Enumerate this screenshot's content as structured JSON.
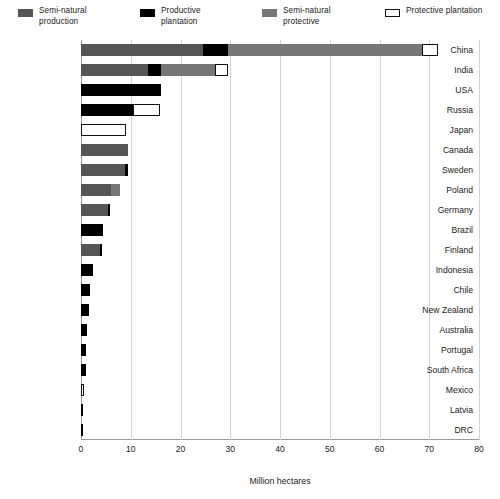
{
  "legend": {
    "items": [
      {
        "label": "Semi-natural\nproduction",
        "key": "sn-prod",
        "color": "#555555"
      },
      {
        "label": "Productive\nplantation",
        "key": "prod-plant",
        "color": "#000000"
      },
      {
        "label": "Semi-natural\nprotective",
        "key": "sn-prot",
        "color": "#777777"
      },
      {
        "label": "Protective plantation",
        "key": "prot-plant",
        "color": "#ffffff"
      }
    ]
  },
  "axis": {
    "x_title": "Million hectares",
    "x_ticks": [
      "0",
      "10",
      "20",
      "30",
      "40",
      "50",
      "60",
      "70",
      "80"
    ]
  },
  "chart_data": {
    "type": "bar",
    "orientation": "horizontal",
    "stacked": true,
    "title": "",
    "xlabel": "Million hectares",
    "ylabel": "",
    "xlim": [
      0,
      80
    ],
    "xticks": [
      0,
      10,
      20,
      30,
      40,
      50,
      60,
      70,
      80
    ],
    "grid": true,
    "legend_position": "top",
    "categories": [
      "China",
      "India",
      "USA",
      "Russia",
      "Japan",
      "Canada",
      "Sweden",
      "Poland",
      "Germany",
      "Brazil",
      "Finland",
      "Indonesia",
      "Chile",
      "New Zealand",
      "Australia",
      "Portugal",
      "South Africa",
      "Mexico",
      "Latvia",
      "DRC"
    ],
    "series": [
      {
        "name": "Semi-natural production",
        "color": "#555555",
        "values": [
          24.5,
          13.5,
          0,
          0,
          0,
          9.5,
          8.8,
          6.0,
          5.5,
          0,
          3.8,
          0,
          0,
          0,
          0,
          0,
          0,
          0,
          0,
          0
        ]
      },
      {
        "name": "Productive plantation",
        "color": "#000000",
        "values": [
          5.0,
          2.5,
          16.0,
          10.5,
          0,
          0,
          0.7,
          0,
          0.2,
          4.4,
          0.3,
          2.4,
          1.9,
          1.6,
          1.2,
          1.0,
          1.0,
          0,
          0.3,
          0.05
        ]
      },
      {
        "name": "Semi-natural protective",
        "color": "#777777",
        "values": [
          39.1,
          11.0,
          0,
          0,
          0,
          0,
          0,
          1.8,
          0,
          0,
          0,
          0,
          0,
          0,
          0,
          0,
          0,
          0,
          0,
          0
        ]
      },
      {
        "name": "Protective plantation",
        "color": "#ffffff",
        "values": [
          3.2,
          2.5,
          0,
          5.3,
          9.0,
          0,
          0,
          0,
          0,
          0,
          0,
          0,
          0,
          0,
          0,
          0,
          0,
          0.7,
          0,
          0
        ]
      }
    ],
    "totals": [
      71.8,
      29.5,
      16.0,
      15.8,
      9.0,
      9.5,
      9.5,
      7.8,
      5.7,
      4.4,
      4.1,
      2.4,
      1.9,
      1.6,
      1.2,
      1.0,
      1.0,
      0.7,
      0.3,
      0.05
    ]
  }
}
